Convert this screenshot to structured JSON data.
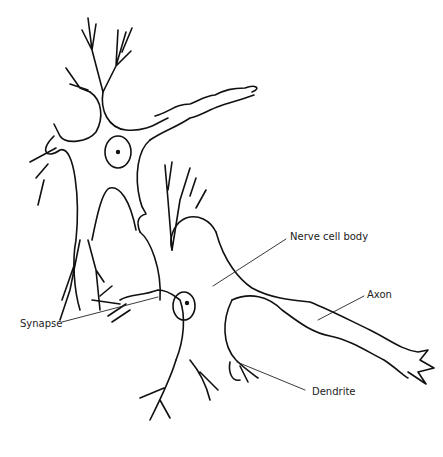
{
  "diagram": {
    "labels": [
      {
        "id": "nerve-cell-body",
        "text": "Nerve cell body"
      },
      {
        "id": "axon",
        "text": "Axon"
      },
      {
        "id": "synapse",
        "text": "Synapse"
      },
      {
        "id": "dendrite",
        "text": "Dendrite"
      }
    ],
    "colors": {
      "line": "#111111",
      "background": "#ffffff"
    }
  }
}
